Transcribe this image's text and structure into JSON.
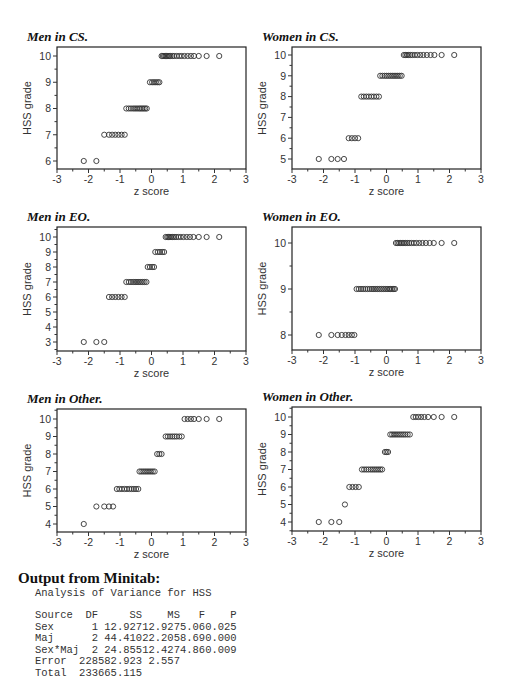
{
  "chart_data": [
    {
      "id": "men-cs",
      "type": "scatter",
      "title": "Men in CS.",
      "xlabel": "z score",
      "ylabel": "HSS grade",
      "xlim": [
        -3,
        3
      ],
      "ylim": [
        5.7,
        10.4
      ],
      "xticks": [
        -3,
        -2,
        -1,
        0,
        1,
        2,
        3
      ],
      "yticks": [
        6,
        7,
        8,
        9,
        10
      ],
      "frame": {
        "left": 57,
        "top": 47,
        "right": 246,
        "bottom": 169
      },
      "ypix": {
        "lo": 6,
        "lo_px": 161,
        "hi": 10,
        "hi_px": 56
      },
      "points": [
        {
          "y": 6,
          "x": [
            -2.15,
            -1.75
          ]
        },
        {
          "y": 7,
          "x": [
            -1.5,
            -1.35,
            -1.25,
            -1.15,
            -1.05,
            -0.95,
            -0.85
          ]
        },
        {
          "y": 8,
          "x": [
            -0.8,
            -0.72,
            -0.65,
            -0.58,
            -0.52,
            -0.46,
            -0.4,
            -0.35,
            -0.3,
            -0.25,
            -0.2,
            -0.15
          ]
        },
        {
          "y": 9,
          "x": [
            -0.05,
            0.02,
            0.08,
            0.14,
            0.2,
            0.25
          ]
        },
        {
          "y": 10,
          "x": [
            0.32,
            0.36,
            0.4,
            0.44,
            0.48,
            0.52,
            0.56,
            0.6,
            0.66,
            0.72,
            0.8,
            0.88,
            0.96,
            1.05,
            1.15,
            1.25,
            1.35,
            1.5,
            1.75,
            2.15
          ]
        }
      ]
    },
    {
      "id": "women-cs",
      "type": "scatter",
      "title": "Women in CS.",
      "xlabel": "z score",
      "ylabel": "HSS grade",
      "xlim": [
        -3,
        3
      ],
      "ylim": [
        4.6,
        10.4
      ],
      "xticks": [
        -3,
        -2,
        -1,
        0,
        1,
        2,
        3
      ],
      "yticks": [
        5,
        6,
        7,
        8,
        9,
        10
      ],
      "frame": {
        "left": 292,
        "top": 47,
        "right": 481,
        "bottom": 169
      },
      "ypix": {
        "lo": 5,
        "lo_px": 159,
        "hi": 10,
        "hi_px": 55
      },
      "points": [
        {
          "y": 5,
          "x": [
            -2.15,
            -1.75,
            -1.55,
            -1.35
          ]
        },
        {
          "y": 6,
          "x": [
            -1.2,
            -1.1,
            -1.0,
            -0.9
          ]
        },
        {
          "y": 8,
          "x": [
            -0.8,
            -0.72,
            -0.64,
            -0.56,
            -0.48,
            -0.4,
            -0.32,
            -0.24
          ]
        },
        {
          "y": 9,
          "x": [
            -0.2,
            -0.13,
            -0.06,
            0.0,
            0.06,
            0.12,
            0.18,
            0.24,
            0.3,
            0.36,
            0.42,
            0.48
          ]
        },
        {
          "y": 10,
          "x": [
            0.55,
            0.6,
            0.65,
            0.7,
            0.76,
            0.82,
            0.9,
            0.98,
            1.07,
            1.17,
            1.28,
            1.4,
            1.52,
            1.75,
            2.15
          ]
        }
      ]
    },
    {
      "id": "men-eo",
      "type": "scatter",
      "title": "Men in EO.",
      "xlabel": "z score",
      "ylabel": "HSS grade",
      "xlim": [
        -3,
        3
      ],
      "ylim": [
        2.4,
        10.4
      ],
      "xticks": [
        -3,
        -2,
        -1,
        0,
        1,
        2,
        3
      ],
      "yticks": [
        3,
        4,
        5,
        6,
        7,
        8,
        9,
        10
      ],
      "frame": {
        "left": 57,
        "top": 227,
        "right": 246,
        "bottom": 351
      },
      "ypix": {
        "lo": 3,
        "lo_px": 342,
        "hi": 10,
        "hi_px": 237
      },
      "points": [
        {
          "y": 3,
          "x": [
            -2.15,
            -1.75,
            -1.5
          ]
        },
        {
          "y": 6,
          "x": [
            -1.35,
            -1.25,
            -1.15,
            -1.05,
            -0.95,
            -0.85
          ]
        },
        {
          "y": 7,
          "x": [
            -0.8,
            -0.72,
            -0.65,
            -0.58,
            -0.52,
            -0.46,
            -0.4,
            -0.34,
            -0.28,
            -0.22,
            -0.16
          ]
        },
        {
          "y": 8,
          "x": [
            -0.12,
            -0.05,
            0.02,
            0.08
          ]
        },
        {
          "y": 9,
          "x": [
            0.12,
            0.2,
            0.27,
            0.34,
            0.4
          ]
        },
        {
          "y": 10,
          "x": [
            0.45,
            0.5,
            0.54,
            0.58,
            0.62,
            0.67,
            0.72,
            0.78,
            0.85,
            0.93,
            1.02,
            1.12,
            1.22,
            1.33,
            1.5,
            1.75,
            2.15
          ]
        }
      ]
    },
    {
      "id": "women-eo",
      "type": "scatter",
      "title": "Women in EO.",
      "xlabel": "z score",
      "ylabel": "HSS grade",
      "xlim": [
        -3,
        3
      ],
      "ylim": [
        7.66,
        10.34
      ],
      "xticks": [
        -3,
        -2,
        -1,
        0,
        1,
        2,
        3
      ],
      "yticks": [
        8,
        9,
        10
      ],
      "frame": {
        "left": 292,
        "top": 227,
        "right": 481,
        "bottom": 350
      },
      "ypix": {
        "lo": 8,
        "lo_px": 335,
        "hi": 10,
        "hi_px": 243
      },
      "points": [
        {
          "y": 8,
          "x": [
            -2.15,
            -1.75,
            -1.55,
            -1.42,
            -1.3,
            -1.2,
            -1.1,
            -1.02
          ]
        },
        {
          "y": 9,
          "x": [
            -0.95,
            -0.88,
            -0.81,
            -0.74,
            -0.67,
            -0.6,
            -0.53,
            -0.46,
            -0.4,
            -0.34,
            -0.28,
            -0.22,
            -0.16,
            -0.1,
            -0.04,
            0.02,
            0.08,
            0.13,
            0.18,
            0.23,
            0.27
          ]
        },
        {
          "y": 10,
          "x": [
            0.3,
            0.35,
            0.4,
            0.45,
            0.5,
            0.55,
            0.6,
            0.66,
            0.72,
            0.79,
            0.87,
            0.95,
            1.04,
            1.14,
            1.25,
            1.37,
            1.5,
            1.75,
            2.15
          ]
        }
      ]
    },
    {
      "id": "men-other",
      "type": "scatter",
      "title": "Men in Other.",
      "xlabel": "z score",
      "ylabel": "HSS grade",
      "xlim": [
        -3,
        3
      ],
      "ylim": [
        3.5,
        10.5
      ],
      "xticks": [
        -3,
        -2,
        -1,
        0,
        1,
        2,
        3
      ],
      "yticks": [
        4,
        5,
        6,
        7,
        8,
        9,
        10
      ],
      "frame": {
        "left": 57,
        "top": 409,
        "right": 246,
        "bottom": 532
      },
      "ypix": {
        "lo": 4,
        "lo_px": 524,
        "hi": 10,
        "hi_px": 419
      },
      "points": [
        {
          "y": 4,
          "x": [
            -2.15
          ]
        },
        {
          "y": 5,
          "x": [
            -1.75,
            -1.5,
            -1.35,
            -1.22
          ]
        },
        {
          "y": 6,
          "x": [
            -1.1,
            -1.02,
            -0.94,
            -0.86,
            -0.78,
            -0.7,
            -0.63,
            -0.56,
            -0.49,
            -0.42
          ]
        },
        {
          "y": 7,
          "x": [
            -0.38,
            -0.32,
            -0.26,
            -0.2,
            -0.14,
            -0.08,
            -0.02,
            0.04,
            0.1
          ]
        },
        {
          "y": 8,
          "x": [
            0.18,
            0.25,
            0.32
          ]
        },
        {
          "y": 9,
          "x": [
            0.45,
            0.52,
            0.59,
            0.66,
            0.73,
            0.8,
            0.88,
            0.96
          ]
        },
        {
          "y": 10,
          "x": [
            1.05,
            1.15,
            1.25,
            1.35,
            1.5,
            1.75,
            2.15
          ]
        }
      ]
    },
    {
      "id": "women-other",
      "type": "scatter",
      "title": "Women in Other.",
      "xlabel": "z score",
      "ylabel": "HSS grade",
      "xlim": [
        -3,
        3
      ],
      "ylim": [
        3.5,
        10.5
      ],
      "xticks": [
        -3,
        -2,
        -1,
        0,
        1,
        2,
        3
      ],
      "yticks": [
        4,
        5,
        6,
        7,
        8,
        9,
        10
      ],
      "frame": {
        "left": 292,
        "top": 407,
        "right": 481,
        "bottom": 531
      },
      "ypix": {
        "lo": 4,
        "lo_px": 522,
        "hi": 10,
        "hi_px": 417
      },
      "points": [
        {
          "y": 4,
          "x": [
            -2.15,
            -1.75,
            -1.5
          ]
        },
        {
          "y": 5,
          "x": [
            -1.32
          ]
        },
        {
          "y": 6,
          "x": [
            -1.18,
            -1.08,
            -0.98,
            -0.88
          ]
        },
        {
          "y": 7,
          "x": [
            -0.78,
            -0.71,
            -0.64,
            -0.57,
            -0.5,
            -0.44,
            -0.38,
            -0.32,
            -0.26,
            -0.2,
            -0.14
          ]
        },
        {
          "y": 8,
          "x": [
            -0.05,
            0.0,
            0.05
          ]
        },
        {
          "y": 9,
          "x": [
            0.12,
            0.18,
            0.24,
            0.3,
            0.36,
            0.42,
            0.48,
            0.54,
            0.6,
            0.67,
            0.74
          ]
        },
        {
          "y": 10,
          "x": [
            0.85,
            0.93,
            1.01,
            1.1,
            1.2,
            1.32,
            1.5,
            1.75,
            2.15
          ]
        }
      ]
    }
  ],
  "output": {
    "heading": "Output from Minitab:",
    "analysis_title": "Analysis of Variance for HSS",
    "table": {
      "columns": [
        "Source",
        "DF",
        "SS",
        "MS",
        "F",
        "P"
      ],
      "rows": [
        {
          "source": "Sex",
          "df": "1",
          "ss": "12.927",
          "ms": "12.927",
          "f": "5.06",
          "p": "0.025"
        },
        {
          "source": "Maj",
          "df": "2",
          "ss": "44.410",
          "ms": "22.205",
          "f": "8.69",
          "p": "0.000"
        },
        {
          "source": "Sex*Maj",
          "df": "2",
          "ss": "24.855",
          "ms": "12.427",
          "f": "4.86",
          "p": "0.009"
        },
        {
          "source": "Error",
          "df": "228",
          "ss": "582.923",
          "ms": "2.557",
          "f": "",
          "p": ""
        },
        {
          "source": "Total",
          "df": "233",
          "ss": "665.115",
          "ms": "",
          "f": "",
          "p": ""
        }
      ]
    }
  }
}
